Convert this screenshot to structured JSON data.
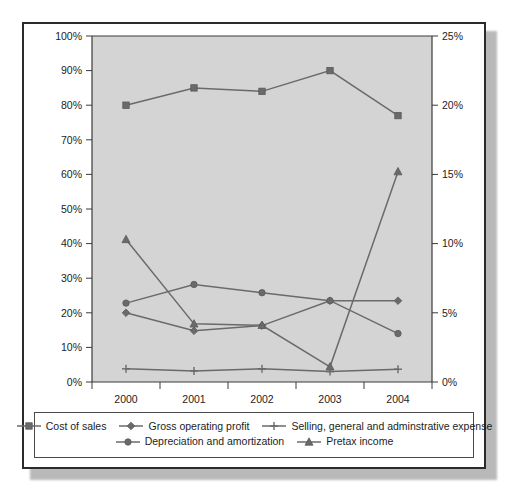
{
  "chart_data": {
    "type": "line",
    "title": "",
    "subtitle": "",
    "xlabel": "",
    "ylabel": "",
    "categories": [
      "2000",
      "2001",
      "2002",
      "2003",
      "2004"
    ],
    "left_axis": {
      "label": "",
      "ylim": [
        0,
        100
      ],
      "tick_step": 10,
      "ticks": [
        "0%",
        "10%",
        "20%",
        "30%",
        "40%",
        "50%",
        "60%",
        "70%",
        "80%",
        "90%",
        "100%"
      ]
    },
    "right_axis": {
      "label": "",
      "ylim": [
        0,
        25
      ],
      "tick_step": 5,
      "ticks": [
        "0%",
        "5%",
        "10%",
        "15%",
        "20%",
        "25%"
      ]
    },
    "grid": false,
    "legend_position": "bottom",
    "plot_background": "#d4d4d4",
    "line_color": "#6a6a6a",
    "series": [
      {
        "name": "Cost of sales",
        "axis": "left",
        "marker": "square",
        "values": [
          80,
          85,
          84,
          90,
          77
        ]
      },
      {
        "name": "Gross operating profit",
        "axis": "left",
        "marker": "diamond",
        "values": [
          20,
          14.8,
          16.3,
          23.5,
          23.5
        ]
      },
      {
        "name": "Selling, general and adminstrative expense",
        "axis": "left",
        "marker": "plus",
        "values": [
          3.8,
          3.2,
          3.8,
          3.0,
          3.7
        ]
      },
      {
        "name": "Depreciation and amortization",
        "axis": "left",
        "marker": "circle",
        "values": [
          22.8,
          28.2,
          25.8,
          23.5,
          14.0
        ]
      },
      {
        "name": "Pretax income",
        "axis": "right",
        "marker": "triangle",
        "values": [
          10.3,
          4.2,
          4.1,
          1.1,
          15.2
        ]
      }
    ]
  },
  "legend": {
    "row1": [
      {
        "label": "Cost of sales",
        "marker": "square"
      },
      {
        "label": "Gross operating profit",
        "marker": "diamond"
      },
      {
        "label": "Selling, general and adminstrative expense",
        "marker": "plus"
      }
    ],
    "row2": [
      {
        "label": "Depreciation and amortization",
        "marker": "circle"
      },
      {
        "label": "Pretax income",
        "marker": "triangle"
      }
    ]
  }
}
